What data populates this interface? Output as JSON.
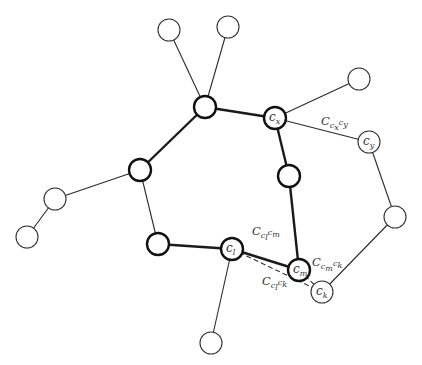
{
  "diagram": {
    "title": "",
    "nodes": [
      {
        "id": "leaf_top_left",
        "x": 169,
        "y": 30,
        "r": 11,
        "bold": false,
        "label": ""
      },
      {
        "id": "leaf_top_right",
        "x": 228,
        "y": 27,
        "r": 11,
        "bold": false,
        "label": ""
      },
      {
        "id": "hub_top",
        "x": 205,
        "y": 107,
        "r": 11,
        "bold": true,
        "label": ""
      },
      {
        "id": "c_x",
        "x": 275,
        "y": 118,
        "r": 11,
        "bold": true,
        "label": "c",
        "sub": "x"
      },
      {
        "id": "leaf_right",
        "x": 359,
        "y": 79,
        "r": 11,
        "bold": false,
        "label": ""
      },
      {
        "id": "c_y",
        "x": 369,
        "y": 142,
        "r": 11,
        "bold": false,
        "label": "c",
        "sub": "y"
      },
      {
        "id": "node_far_right",
        "x": 395,
        "y": 217,
        "r": 11,
        "bold": false,
        "label": ""
      },
      {
        "id": "c_k",
        "x": 322,
        "y": 292,
        "r": 11,
        "bold": false,
        "label": "c",
        "sub": "k"
      },
      {
        "id": "c_m",
        "x": 299,
        "y": 270,
        "r": 11,
        "bold": true,
        "label": "c",
        "sub": "m"
      },
      {
        "id": "ring_mid_right",
        "x": 289,
        "y": 176,
        "r": 11,
        "bold": true,
        "label": ""
      },
      {
        "id": "c_l",
        "x": 232,
        "y": 249,
        "r": 11,
        "bold": true,
        "label": "c",
        "sub": "l"
      },
      {
        "id": "ring_bottom_left",
        "x": 158,
        "y": 244,
        "r": 11,
        "bold": true,
        "label": ""
      },
      {
        "id": "ring_left",
        "x": 140,
        "y": 170,
        "r": 11,
        "bold": true,
        "label": ""
      },
      {
        "id": "leaf_left",
        "x": 55,
        "y": 199,
        "r": 11,
        "bold": false,
        "label": ""
      },
      {
        "id": "leaf_far_left",
        "x": 27,
        "y": 237,
        "r": 11,
        "bold": false,
        "label": ""
      },
      {
        "id": "leaf_bottom",
        "x": 211,
        "y": 343,
        "r": 11,
        "bold": false,
        "label": ""
      }
    ],
    "edges": [
      {
        "from": "leaf_top_left",
        "to": "hub_top",
        "style": "thin"
      },
      {
        "from": "leaf_top_right",
        "to": "hub_top",
        "style": "thin"
      },
      {
        "from": "hub_top",
        "to": "c_x",
        "style": "bold"
      },
      {
        "from": "hub_top",
        "to": "ring_left",
        "style": "bold"
      },
      {
        "from": "c_x",
        "to": "leaf_right",
        "style": "thin"
      },
      {
        "from": "c_x",
        "to": "c_y",
        "style": "thin"
      },
      {
        "from": "c_x",
        "to": "ring_mid_right",
        "style": "bold"
      },
      {
        "from": "ring_mid_right",
        "to": "c_m",
        "style": "bold"
      },
      {
        "from": "c_y",
        "to": "node_far_right",
        "style": "thin"
      },
      {
        "from": "node_far_right",
        "to": "c_k",
        "style": "thin"
      },
      {
        "from": "c_m",
        "to": "c_l",
        "style": "bold"
      },
      {
        "from": "c_l",
        "to": "ring_bottom_left",
        "style": "bold"
      },
      {
        "from": "ring_bottom_left",
        "to": "ring_left",
        "style": "thin"
      },
      {
        "from": "ring_left",
        "to": "leaf_left",
        "style": "thin"
      },
      {
        "from": "leaf_left",
        "to": "leaf_far_left",
        "style": "thin"
      },
      {
        "from": "c_l",
        "to": "leaf_bottom",
        "style": "thin"
      },
      {
        "from": "c_l",
        "to": "c_k",
        "style": "dashed"
      },
      {
        "from": "c_m",
        "to": "c_k",
        "style": "dashed"
      }
    ],
    "edge_labels": [
      {
        "id": "C_cx_cy",
        "x": 321,
        "y": 125,
        "main": "C",
        "sub": "c",
        "subsub": "x",
        "tail": "c",
        "tail_sub": "y"
      },
      {
        "id": "C_cl_cm",
        "x": 252,
        "y": 235,
        "main": "C",
        "sub": "c",
        "subsub": "l",
        "tail": "c",
        "tail_sub": "m"
      },
      {
        "id": "C_cm_ck",
        "x": 312,
        "y": 266,
        "main": "C",
        "sub": "c",
        "subsub": "m",
        "tail": "c",
        "tail_sub": "k"
      },
      {
        "id": "C_cl_ck",
        "x": 262,
        "y": 285,
        "main": "C",
        "sub": "c",
        "subsub": "l",
        "tail": "c",
        "tail_sub": "k"
      }
    ]
  }
}
